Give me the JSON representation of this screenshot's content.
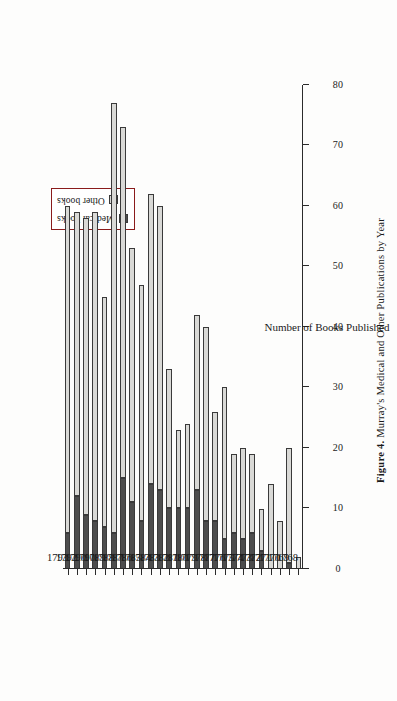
{
  "figure": {
    "caption_label": "Figure 4.",
    "caption_text": "Murray's Medical and Other Publications by Year"
  },
  "legend": {
    "items": [
      {
        "label": "Medical books",
        "color": "#4d4d4d",
        "name": "medical-books"
      },
      {
        "label": "Other books",
        "color": "#d9d9d6",
        "name": "other-books"
      }
    ]
  },
  "chart_data": {
    "type": "bar",
    "orientation": "horizontal",
    "stacked": true,
    "title": "Figure 4. Murray's Medical and Other Publications by Year",
    "xlabel": "Number of Books Published",
    "ylabel": "",
    "xlim": [
      0,
      80
    ],
    "xticks": [
      0,
      10,
      20,
      30,
      40,
      50,
      60,
      70,
      80
    ],
    "xtick_labels": [
      "0",
      "10",
      "20",
      "30",
      "40",
      "50",
      "60",
      "70",
      "80"
    ],
    "grid": false,
    "legend_position": "top-left",
    "categories": [
      "1793",
      "1792",
      "1790",
      "1790",
      "1789",
      "1788",
      "1787",
      "1786",
      "1785",
      "1784",
      "1783",
      "1782",
      "1781",
      "1780",
      "1779",
      "1778",
      "1777",
      "1776",
      "1775",
      "1774",
      "1773",
      "1772",
      "1771",
      "1770",
      "1769",
      "1768"
    ],
    "series": [
      {
        "name": "Medical books",
        "color": "#4d4d4d",
        "values": [
          6,
          12,
          9,
          8,
          7,
          6,
          15,
          11,
          8,
          14,
          13,
          10,
          10,
          10,
          13,
          8,
          8,
          5,
          6,
          5,
          6,
          3,
          0,
          0,
          1,
          0
        ]
      },
      {
        "name": "Other books",
        "color": "#d9d9d6",
        "values": [
          54,
          47,
          49,
          51,
          38,
          71,
          58,
          42,
          39,
          48,
          47,
          23,
          13,
          14,
          29,
          32,
          18,
          25,
          13,
          15,
          13,
          7,
          14,
          8,
          19,
          2
        ]
      }
    ],
    "totals": [
      60,
      59,
      58,
      59,
      45,
      77,
      73,
      53,
      47,
      62,
      60,
      33,
      23,
      24,
      42,
      40,
      26,
      30,
      19,
      20,
      19,
      10,
      14,
      8,
      20,
      2
    ]
  }
}
